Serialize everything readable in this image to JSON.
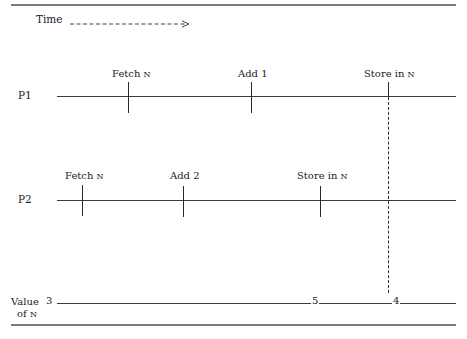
{
  "diagram": {
    "time_label": "Time",
    "time_arrow": "time-arrow-dashed-right",
    "processes": [
      {
        "label": "P1",
        "events": [
          {
            "label": "Fetch",
            "var": "N"
          },
          {
            "label": "Add 1",
            "var": ""
          },
          {
            "label": "Store in",
            "var": "N"
          }
        ]
      },
      {
        "label": "P2",
        "events": [
          {
            "label": "Fetch",
            "var": "N"
          },
          {
            "label": "Add 2",
            "var": ""
          },
          {
            "label": "Store in",
            "var": "N"
          }
        ]
      }
    ],
    "value_row": {
      "label_line1": "Value",
      "label_line2_prefix": "of",
      "label_var": "N",
      "values": [
        "3",
        "5",
        "4"
      ]
    },
    "colors": {
      "rule": "#7a7a7a",
      "line": "#3a3a3a",
      "text": "#1a1a1a"
    }
  }
}
